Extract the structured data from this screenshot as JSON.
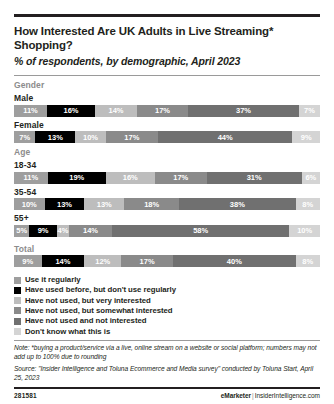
{
  "header": {
    "title": "How Interested Are UK Adults in Live Streaming* Shopping?",
    "subtitle": "% of respondents, by demographic, April 2023"
  },
  "groups": {
    "gender_label": "Gender",
    "age_label": "Age",
    "total_label": "Total"
  },
  "note": {
    "note_text": "Note: *buying a product/service via a live, online stream on a website or social platform; numbers may not add up to 100% due to rounding",
    "source_text": "Source: \"Insider Intelligence and Toluna Ecommerce and Media survey\" conducted by Toluna Start, April 25, 2023"
  },
  "footer": {
    "id": "281581",
    "brand": "eMarketer",
    "separator": "|",
    "site": "InsiderIntelligence.com"
  },
  "chart_data": {
    "type": "bar",
    "title": "How Interested Are UK Adults in Live Streaming* Shopping?",
    "subtitle": "% of respondents, by demographic, April 2023",
    "xlabel": "",
    "ylabel": "",
    "xlim": [
      0,
      100
    ],
    "grid": false,
    "legend_position": "bottom",
    "stacked": true,
    "orientation": "horizontal",
    "categories": [
      "Male",
      "Female",
      "18-34",
      "35-54",
      "55+",
      "Total"
    ],
    "series": [
      {
        "name": "Use it regularly",
        "color": "#9e9e9e",
        "text_color": "#ffffff",
        "values": [
          11,
          7,
          11,
          10,
          5,
          9
        ]
      },
      {
        "name": "Have used before, but don't use regularly",
        "color": "#000000",
        "text_color": "#ffffff",
        "values": [
          16,
          13,
          19,
          13,
          9,
          14
        ]
      },
      {
        "name": "Have not used, but very interested",
        "color": "#bdbdbd",
        "text_color": "#ffffff",
        "values": [
          14,
          10,
          16,
          13,
          4,
          12
        ]
      },
      {
        "name": "Have not used, but somewhat interested",
        "color": "#8a8a8a",
        "text_color": "#ffffff",
        "values": [
          17,
          17,
          17,
          18,
          14,
          17
        ]
      },
      {
        "name": "Have not used and not interested",
        "color": "#707070",
        "text_color": "#ffffff",
        "values": [
          37,
          44,
          31,
          38,
          58,
          40
        ]
      },
      {
        "name": "Don't know what this is",
        "color": "#d4d4d4",
        "text_color": "#ffffff",
        "values": [
          7,
          9,
          6,
          8,
          10,
          8
        ]
      }
    ],
    "value_labels": {
      "Male": [
        "11%",
        "16%",
        "14%",
        "17%",
        "37%",
        "7%"
      ],
      "Female": [
        "7%",
        "13%",
        "10%",
        "17%",
        "44%",
        "9%"
      ],
      "18-34": [
        "11%",
        "19%",
        "16%",
        "17%",
        "31%",
        "6%"
      ],
      "35-54": [
        "10%",
        "13%",
        "13%",
        "18%",
        "38%",
        "8%"
      ],
      "55+": [
        "5%",
        "9%",
        "4%",
        "14%",
        "58%",
        "10%"
      ],
      "Total": [
        "9%",
        "14%",
        "12%",
        "17%",
        "40%",
        "8%"
      ]
    }
  }
}
